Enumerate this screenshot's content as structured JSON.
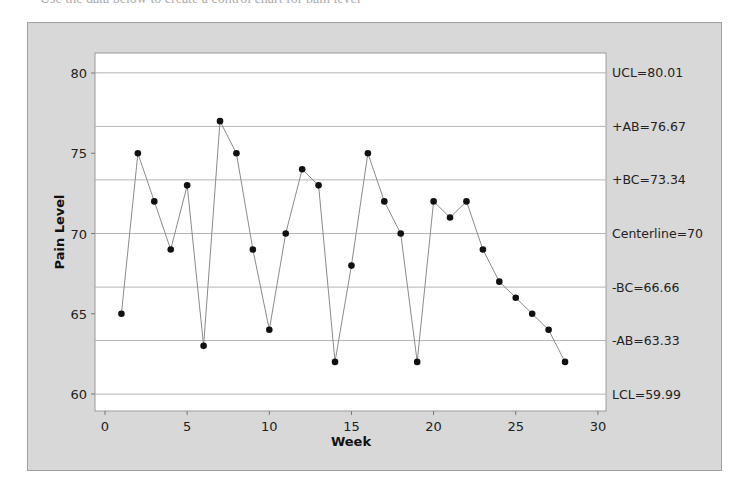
{
  "page": {
    "cutoff_text": "Use the data below to create a control chart for pain level"
  },
  "chart_data": {
    "type": "line",
    "title": "",
    "xlabel": "Week",
    "ylabel": "Pain Level",
    "xlim": [
      0,
      30
    ],
    "ylim": [
      59,
      81
    ],
    "x_ticks": [
      0,
      5,
      10,
      15,
      20,
      25,
      30
    ],
    "y_ticks": [
      60,
      65,
      70,
      75,
      80
    ],
    "grid": false,
    "legend": null,
    "x": [
      1,
      2,
      3,
      4,
      5,
      6,
      7,
      8,
      9,
      10,
      11,
      12,
      13,
      14,
      15,
      16,
      17,
      18,
      19,
      20,
      21,
      22,
      23,
      24,
      25,
      26,
      27,
      28
    ],
    "values": [
      65,
      75,
      72,
      69,
      73,
      63,
      77,
      75,
      69,
      64,
      70,
      74,
      73,
      62,
      68,
      75,
      72,
      70,
      62,
      72,
      71,
      72,
      69,
      67,
      66,
      65,
      64,
      62
    ],
    "series": [
      {
        "name": "Pain Level",
        "x": [
          1,
          2,
          3,
          4,
          5,
          6,
          7,
          8,
          9,
          10,
          11,
          12,
          13,
          14,
          15,
          16,
          17,
          18,
          19,
          20,
          21,
          22,
          23,
          24,
          25,
          26,
          27,
          28
        ],
        "values": [
          65,
          75,
          72,
          69,
          73,
          63,
          77,
          75,
          69,
          64,
          70,
          74,
          73,
          62,
          68,
          75,
          72,
          70,
          62,
          72,
          71,
          72,
          69,
          67,
          66,
          65,
          64,
          62
        ]
      }
    ],
    "reference_lines": [
      {
        "label": "UCL=80.01",
        "value": 80.01
      },
      {
        "label": "+AB=76.67",
        "value": 76.67
      },
      {
        "label": "+BC=73.34",
        "value": 73.34
      },
      {
        "label": "Centerline=70",
        "value": 70
      },
      {
        "label": "-BC=66.66",
        "value": 66.66
      },
      {
        "label": "-AB=63.33",
        "value": 63.33
      },
      {
        "label": "LCL=59.99",
        "value": 59.99
      }
    ],
    "colors": {
      "frame_bg": "#d8d8d8",
      "plot_bg": "#ffffff",
      "line": "#8a8a8a",
      "marker": "#111111",
      "ref_line": "#b4b4b4"
    }
  }
}
